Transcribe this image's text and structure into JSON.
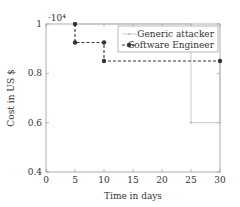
{
  "chart_data": {
    "type": "line",
    "title": "",
    "xlabel": "Time in days",
    "ylabel": "Cost in US $",
    "y_multiplier": "·10⁴",
    "xlim": [
      0,
      30
    ],
    "ylim": [
      0.4,
      1.0
    ],
    "xticks": [
      0,
      5,
      10,
      15,
      20,
      25,
      30
    ],
    "yticks": [
      0.4,
      0.6,
      0.8,
      1
    ],
    "ytick_labels": [
      "0.4",
      "0.6",
      "0.8",
      "1"
    ],
    "grid": false,
    "legend_position": "upper right",
    "series": [
      {
        "name": "Generic attacker",
        "style": "solid",
        "color": "#bbbbbb",
        "marker": "small-dot",
        "points": [
          [
            5,
            1.0
          ],
          [
            10,
            1.0
          ],
          [
            25,
            1.0
          ],
          [
            25,
            0.6
          ],
          [
            30,
            0.6
          ],
          [
            30,
            0.85
          ]
        ]
      },
      {
        "name": "Software Engineer",
        "style": "dashed",
        "color": "#333333",
        "marker": "dot",
        "points": [
          [
            5,
            1.0
          ],
          [
            5,
            0.925
          ],
          [
            10,
            0.925
          ],
          [
            10,
            0.85
          ],
          [
            30,
            0.85
          ]
        ]
      }
    ]
  }
}
